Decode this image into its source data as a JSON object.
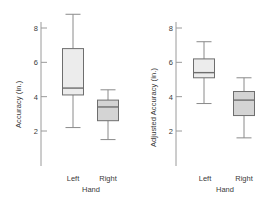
{
  "figure": {
    "background": "#ffffff",
    "axis_color": "#9a9a9a",
    "box_stroke": "#6e6e6e",
    "whisker_color": "#8a8a8a",
    "text_color": "#3a3a3a"
  },
  "chart_data": [
    {
      "type": "box",
      "title": "",
      "xlabel": "Hand",
      "ylabel": "Accuracy (in.)",
      "categories": [
        "Left",
        "Right"
      ],
      "ytick_labels": [
        "2",
        "4",
        "6",
        "8"
      ],
      "yticks": [
        2,
        4,
        6,
        8
      ],
      "ylim": [
        1.0,
        9.2
      ],
      "grid": false,
      "legend": "none",
      "boxes": [
        {
          "category": "Left",
          "min": 2.2,
          "q1": 4.1,
          "median": 4.5,
          "q3": 6.8,
          "max": 8.8,
          "fill": "#ececec"
        },
        {
          "category": "Right",
          "min": 1.5,
          "q1": 2.6,
          "median": 3.4,
          "q3": 3.8,
          "max": 4.4,
          "fill": "#d4d4d4"
        }
      ]
    },
    {
      "type": "box",
      "title": "",
      "xlabel": "Hand",
      "ylabel": "Adjusted Accuracy (in.)",
      "categories": [
        "Left",
        "Right"
      ],
      "ytick_labels": [
        "2",
        "4",
        "6",
        "8"
      ],
      "yticks": [
        2,
        4,
        6,
        8
      ],
      "ylim": [
        1.0,
        9.2
      ],
      "grid": false,
      "legend": "none",
      "boxes": [
        {
          "category": "Left",
          "min": 3.6,
          "q1": 5.1,
          "median": 5.4,
          "q3": 6.2,
          "max": 7.2,
          "fill": "#ececec"
        },
        {
          "category": "Right",
          "min": 1.6,
          "q1": 2.9,
          "median": 3.8,
          "q3": 4.3,
          "max": 5.1,
          "fill": "#d4d4d4"
        }
      ]
    }
  ]
}
